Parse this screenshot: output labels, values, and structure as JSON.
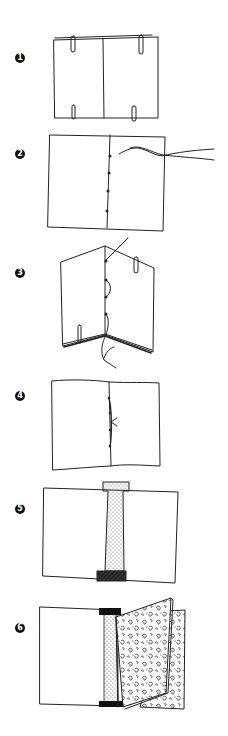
{
  "diagram": {
    "steps": [
      {
        "number": "1",
        "badge": "❶",
        "description": "Stacked folded sheets held with paper clips"
      },
      {
        "number": "2",
        "badge": "❷",
        "description": "Punched holes along fold with needle and thread"
      },
      {
        "number": "3",
        "badge": "❸",
        "description": "Sewing through holes along the spine"
      },
      {
        "number": "4",
        "badge": "❹",
        "description": "Stitched spine with knot tied"
      },
      {
        "number": "5",
        "badge": "❺",
        "description": "Spine strip and headband applied"
      },
      {
        "number": "6",
        "badge": "❻",
        "description": "Attaching marbled cover boards"
      }
    ]
  },
  "colors": {
    "ink": "#222222",
    "background": "#ffffff",
    "badge": "#111111"
  }
}
